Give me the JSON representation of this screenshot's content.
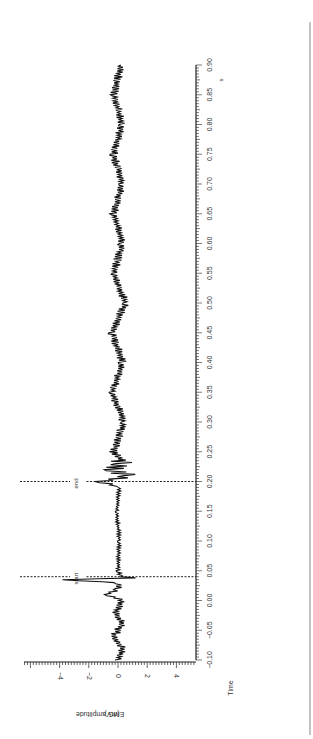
{
  "chart_data": {
    "type": "line",
    "title": "",
    "orientation": "rotated 90° (time axis runs bottom-to-top on right side)",
    "xlabel": "Time",
    "xunit": "s",
    "ylabel": "EMG amplitude",
    "yunit": "(mV)",
    "xlim": [
      -0.1,
      0.9
    ],
    "ylim": [
      -5.8,
      5.8
    ],
    "x_ticks": [
      "-0.10",
      "-0.05",
      "0.00",
      "0.05",
      "0.10",
      "0.15",
      "0.20",
      "0.25",
      "0.30",
      "0.35",
      "0.40",
      "0.45",
      "0.50",
      "0.55",
      "0.60",
      "0.65",
      "0.70",
      "0.75",
      "0.80",
      "0.85",
      "0.90"
    ],
    "y_ticks": [
      "-4",
      "-2",
      "0",
      "2",
      "4"
    ],
    "grid": false,
    "annotations": [
      {
        "label": "start",
        "x": 0.04,
        "style": "dashed vertical line"
      },
      {
        "label": "end",
        "x": 0.2,
        "style": "dashed vertical line"
      }
    ],
    "series": [
      {
        "name": "EMG",
        "description": "Baseline noise ~±0.3 mV; stimulus artifact near t=0.035–0.04 s with negative deflection to about -3.8 mV and positive to +1.2 mV; quiet period 0.04–0.20 s; burst of activity ~0.20–0.23 s (±1.2 mV); continued noise ~±0.4 mV to 0.90 s",
        "x": [
          -0.1,
          -0.08,
          -0.06,
          -0.04,
          -0.02,
          0.0,
          0.01,
          0.02,
          0.03,
          0.035,
          0.038,
          0.04,
          0.05,
          0.1,
          0.15,
          0.19,
          0.2,
          0.21,
          0.22,
          0.23,
          0.25,
          0.3,
          0.35,
          0.4,
          0.45,
          0.5,
          0.55,
          0.6,
          0.65,
          0.7,
          0.75,
          0.8,
          0.85,
          0.9
        ],
        "values": [
          0.0,
          0.3,
          -0.3,
          0.3,
          -0.2,
          0.3,
          -0.8,
          0.1,
          0.0,
          -3.8,
          1.2,
          0.2,
          0.0,
          0.1,
          -0.1,
          0.1,
          -1.2,
          0.9,
          -0.6,
          0.5,
          -0.3,
          0.4,
          -0.4,
          0.3,
          -0.4,
          0.5,
          -0.3,
          0.3,
          -0.3,
          0.3,
          -0.3,
          0.3,
          -0.3,
          0.2
        ]
      }
    ]
  }
}
